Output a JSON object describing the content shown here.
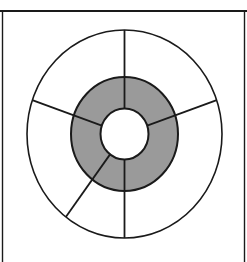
{
  "figure": {
    "canvas": {
      "width": 247,
      "height": 262,
      "background_color": "#ffffff"
    },
    "rules": {
      "top_rule": {
        "name": "top horizontal rule",
        "x1": 0,
        "y1": 11,
        "x2": 247,
        "y2": 11,
        "color": "#1a1a1a",
        "stroke_width": 2.0
      },
      "left_rule": {
        "name": "left vertical border",
        "x1": 2.5,
        "y1": 12,
        "x2": 2.5,
        "y2": 262,
        "color": "#1a1a1a",
        "stroke_width": 1.4
      },
      "right_rule": {
        "name": "right vertical border",
        "x1": 244.5,
        "y1": 12,
        "x2": 244.5,
        "y2": 262,
        "color": "#1a1a1a",
        "stroke_width": 1.4
      }
    },
    "geometry": {
      "center_x": 124.5,
      "center_y": 134,
      "outer_radius_x": 97.5,
      "outer_radius_y": 104,
      "ring_radius_x": 53.5,
      "ring_radius_y": 57,
      "inner_radius_x": 24,
      "inner_radius_y": 25.5
    },
    "style": {
      "stroke_color": "#1a1a1a",
      "outer_stroke_width": 1.6,
      "ring_stroke_width": 2.0,
      "spoke_stroke_width": 1.8,
      "outer_fill": "#ffffff",
      "ring_fill": "#9a9a9a",
      "inner_fill": "#ffffff"
    },
    "spokes": [
      {
        "label": "spoke-north",
        "angle_deg": -90
      },
      {
        "label": "spoke-upper-left",
        "angle_deg": -161
      },
      {
        "label": "spoke-upper-right",
        "angle_deg": -19
      },
      {
        "label": "spoke-lower-left",
        "angle_deg": 127
      },
      {
        "label": "spoke-south",
        "angle_deg": 90
      }
    ],
    "sector_count": 5,
    "ring_count": 3,
    "rings": [
      {
        "name": "outer-band",
        "fill": "#ffffff",
        "label": "outer annulus"
      },
      {
        "name": "middle-band",
        "fill": "#9a9a9a",
        "label": "shaded middle annulus"
      },
      {
        "name": "hub",
        "fill": "#ffffff",
        "label": "central hub"
      }
    ]
  }
}
